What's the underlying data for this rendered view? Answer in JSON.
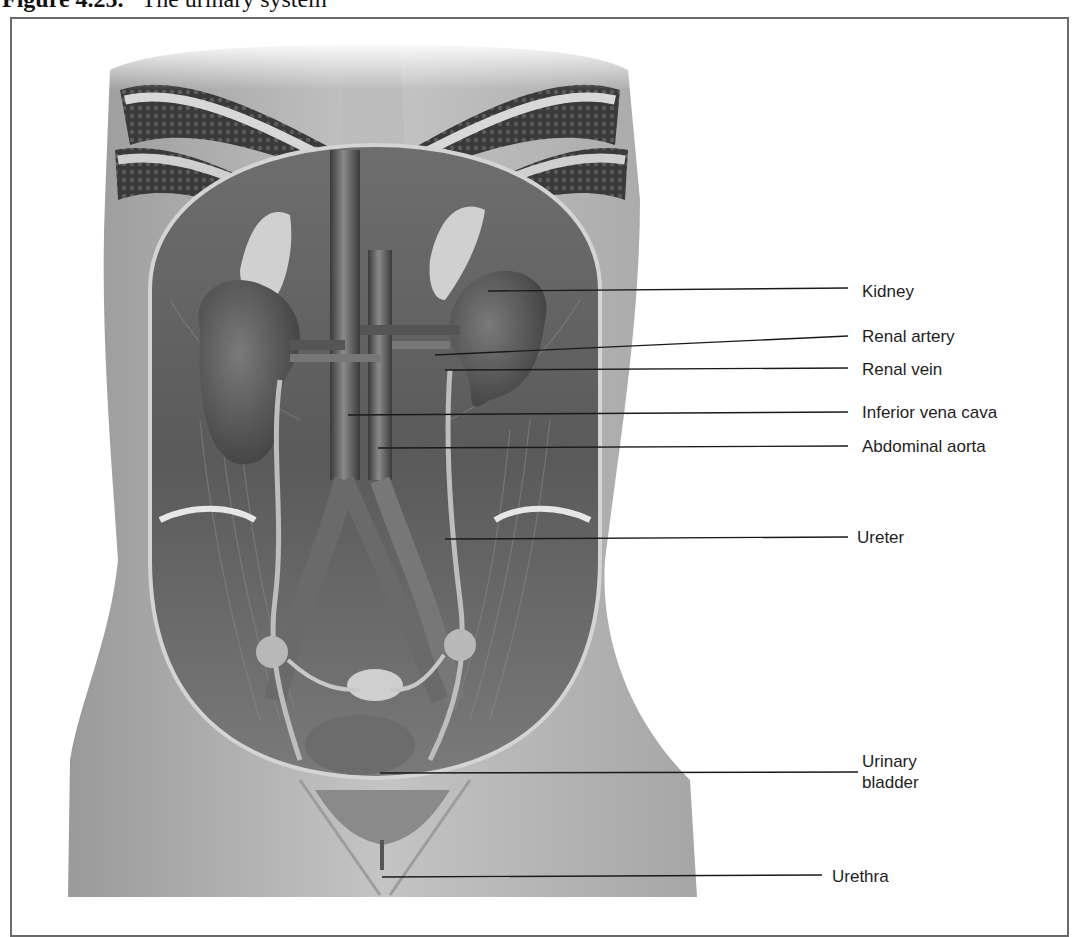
{
  "figure": {
    "number": "Figure 4.25.",
    "title": "The urinary system"
  },
  "illustration": {
    "subject": "anterior view of the female urinary system within the abdominal cavity",
    "style": "grayscale"
  },
  "labels": [
    {
      "id": "kidney",
      "text": "Kidney",
      "x": 862,
      "y": 281,
      "line": {
        "x1": 488,
        "y1": 291,
        "x2": 848,
        "y2": 288
      }
    },
    {
      "id": "renal-artery",
      "text": "Renal artery",
      "x": 862,
      "y": 326,
      "line": {
        "x1": 435,
        "y1": 355,
        "x2": 848,
        "y2": 336
      }
    },
    {
      "id": "renal-vein",
      "text": "Renal vein",
      "x": 862,
      "y": 359,
      "line": {
        "x1": 445,
        "y1": 370,
        "x2": 848,
        "y2": 368
      }
    },
    {
      "id": "inferior-vena-cava",
      "text": "Inferior vena cava",
      "x": 862,
      "y": 402,
      "line": {
        "x1": 348,
        "y1": 415,
        "x2": 848,
        "y2": 412
      }
    },
    {
      "id": "abdominal-aorta",
      "text": "Abdominal aorta",
      "x": 862,
      "y": 436,
      "line": {
        "x1": 378,
        "y1": 448,
        "x2": 848,
        "y2": 446
      }
    },
    {
      "id": "ureter",
      "text": "Ureter",
      "x": 857,
      "y": 527,
      "line": {
        "x1": 445,
        "y1": 539,
        "x2": 848,
        "y2": 537
      }
    },
    {
      "id": "urinary-bladder",
      "text": "Urinary bladder",
      "x": 862,
      "y": 751,
      "line": {
        "x1": 380,
        "y1": 773,
        "x2": 858,
        "y2": 772
      }
    },
    {
      "id": "urethra",
      "text": "Urethra",
      "x": 832,
      "y": 866,
      "line": {
        "x1": 382,
        "y1": 877,
        "x2": 822,
        "y2": 875
      }
    }
  ]
}
